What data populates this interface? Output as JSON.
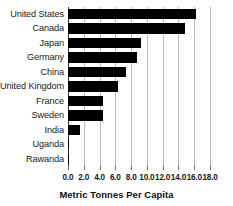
{
  "chart_data": {
    "type": "bar",
    "orientation": "horizontal",
    "title": "",
    "subtitle": "",
    "xlabel": "Metric Tonnes Per Capita",
    "ylabel": "",
    "categories": [
      "United States",
      "Canada",
      "Japan",
      "Germany",
      "China",
      "United Kingdom",
      "France",
      "Sweden",
      "India",
      "Uganda",
      "Rawanda"
    ],
    "values": [
      16.2,
      14.8,
      9.2,
      8.7,
      7.3,
      6.3,
      4.4,
      4.4,
      1.5,
      0.1,
      0.1
    ],
    "xlim": [
      0.0,
      18.0
    ],
    "xticks": [
      0.0,
      2.0,
      4.0,
      6.0,
      8.0,
      10.0,
      12.0,
      14.0,
      16.0,
      18.0
    ],
    "xtick_labels": [
      "0.0",
      "2.0",
      "4.0",
      "6.0",
      "8.0",
      "10.0",
      "12.0",
      "14.0",
      "16.0",
      "18.0"
    ],
    "grid": "vertical",
    "legend": null,
    "bar_color": "#000000",
    "grid_color": "#b9b9b9",
    "axis_color": "#3a3a3a",
    "background": "#ffffff"
  }
}
